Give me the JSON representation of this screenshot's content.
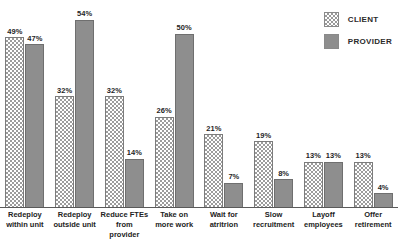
{
  "legend": {
    "items": [
      {
        "label": "CLIENT",
        "swatch": "checkered-swatch",
        "color": "#9c9c9c"
      },
      {
        "label": "PROVIDER",
        "swatch": "solid-swatch",
        "color": "#8e8e8e"
      }
    ]
  },
  "chart_data": {
    "type": "bar",
    "title": "",
    "subtitle": "",
    "xlabel": "",
    "ylabel": "",
    "ylim": [
      0,
      56
    ],
    "grid": false,
    "legend_position": "top-right",
    "value_suffix": "%",
    "categories": [
      "Redeploy within unit",
      "Redeploy outside unit",
      "Reduce FTEs from provider",
      "Take on more work",
      "Wait for atritrion",
      "Slow recruitment",
      "Layoff employees",
      "Offer retirement"
    ],
    "category_lines": [
      [
        "Redeploy",
        "within unit"
      ],
      [
        "Redeploy",
        "outside unit"
      ],
      [
        "Reduce FTEs",
        "from provider"
      ],
      [
        "Take on",
        "more work"
      ],
      [
        "Wait for",
        "atritrion"
      ],
      [
        "Slow",
        "recruitment"
      ],
      [
        "Layoff",
        "employees"
      ],
      [
        "Offer",
        "retirement"
      ]
    ],
    "series": [
      {
        "name": "CLIENT",
        "values": [
          49,
          32,
          32,
          26,
          21,
          19,
          13,
          13
        ],
        "labels": [
          "49%",
          "32%",
          "32%",
          "26%",
          "21%",
          "19%",
          "13%",
          "13%"
        ]
      },
      {
        "name": "PROVIDER",
        "values": [
          47,
          54,
          14,
          50,
          7,
          8,
          13,
          4
        ],
        "labels": [
          "47%",
          "54%",
          "14%",
          "50%",
          "7%",
          "8%",
          "13%",
          "4%"
        ]
      }
    ]
  }
}
